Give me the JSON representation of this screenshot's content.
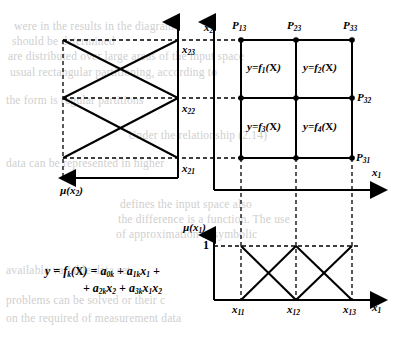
{
  "figure": {
    "axes": {
      "x1_label": "x1",
      "x2_label": "x2",
      "mu_x1_label": "µ(x1)",
      "mu_x2_label": "µ(x2)",
      "mu_one": "1"
    },
    "x2_ticks": [
      {
        "name": "x21",
        "base": "x",
        "sub": "21"
      },
      {
        "name": "x22",
        "base": "x",
        "sub": "22"
      },
      {
        "name": "x23",
        "base": "x",
        "sub": "23"
      }
    ],
    "x1_ticks": [
      {
        "name": "x11",
        "base": "x",
        "sub": "11"
      },
      {
        "name": "x12",
        "base": "x",
        "sub": "12"
      },
      {
        "name": "x13",
        "base": "x",
        "sub": "13"
      }
    ],
    "grid_points": [
      {
        "name": "P13",
        "base": "P",
        "sub": "13"
      },
      {
        "name": "P23",
        "base": "P",
        "sub": "23"
      },
      {
        "name": "P33",
        "base": "P",
        "sub": "33"
      },
      {
        "name": "P32",
        "base": "P",
        "sub": "32"
      },
      {
        "name": "P31",
        "base": "P",
        "sub": "31"
      }
    ],
    "cells": [
      {
        "name": "f1",
        "prefix": "y=f",
        "sub": "1",
        "suffix": "(X)"
      },
      {
        "name": "f2",
        "prefix": "y=f",
        "sub": "2",
        "suffix": "(X)"
      },
      {
        "name": "f3",
        "prefix": "y=f",
        "sub": "3",
        "suffix": "(X)"
      },
      {
        "name": "f4",
        "prefix": "y=f",
        "sub": "4",
        "suffix": "(X)"
      }
    ],
    "formula": {
      "line1_a": "y = f",
      "line1_sub": "k",
      "line1_b": "(X) = a",
      "line1_sub2": "0k",
      "line1_c": " + a",
      "line1_sub3": "1k",
      "line1_d": "x",
      "line1_sub4": "1",
      "line1_e": " +",
      "line2_a": "+ a",
      "line2_sub1": "2k",
      "line2_b": "x",
      "line2_sub2": "2",
      "line2_c": " + a",
      "line2_sub3": "3k",
      "line2_d": "x",
      "line2_sub4": "1",
      "line2_e": "x",
      "line2_sub5": "2"
    },
    "colors": {
      "line": "#000000",
      "background": "#ffffff",
      "bleed_text": "#cfcfcf"
    }
  },
  "background_bleed": {
    "lines_top": [
      "were in the results in the diagram",
      "should be determined",
      "are distributed over large areas of the input space",
      "usual rectangular partitioning, according to"
    ],
    "lines_mid": [
      "the form is regular partitions",
      "Under the relationship (2.14)",
      "data can be represented in higher",
      "defines the input space also",
      "the difference is a function. The use",
      "of approximation at symbolic",
      "available variable data set",
      "problems can be solved or their c",
      "on the required of measurement data"
    ]
  }
}
